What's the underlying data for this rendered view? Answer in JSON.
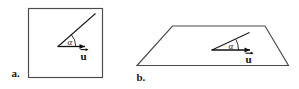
{
  "figure": {
    "title": "",
    "background_color": "#ffffff",
    "ink_color": "#1a1a1a",
    "panels": [
      {
        "id": "a",
        "caption": "a.",
        "shape": "square",
        "shape_description": "square plane seen face-on",
        "angle_label": "α",
        "vector_label": "u",
        "vector_has_overarrow": true
      },
      {
        "id": "b",
        "caption": "b.",
        "shape": "trapezoid",
        "shape_description": "same plane drawn in perspective",
        "angle_label": "α",
        "vector_label": "u",
        "vector_has_overarrow": true
      }
    ]
  },
  "colors": {
    "stroke": "#4a4a4a",
    "text": "#1a1a1a",
    "vector": "#111111"
  }
}
